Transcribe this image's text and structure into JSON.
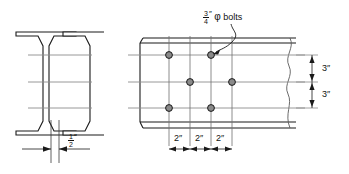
{
  "drawing": {
    "title": "Bolted beam web connection detail",
    "background_color": "#ffffff",
    "line_color": "#1a1a1a",
    "centerline_color": "#8c8c8c",
    "bolt_fill_color": "#8a8a8a"
  },
  "section_view": {
    "name": "I-beam cross section",
    "web_dimension": {
      "value_numerator": "1",
      "value_denominator": "2",
      "unit_mark": "″"
    }
  },
  "elevation_view": {
    "name": "Beam web elevation with staggered bolt group",
    "bolt_note": {
      "numerator": "3",
      "denominator": "4",
      "unit_mark": "″",
      "symbol": "φ",
      "text": "bolts"
    },
    "horizontal_dimensions": [
      {
        "label": "2″"
      },
      {
        "label": "2″"
      },
      {
        "label": "2″"
      }
    ],
    "vertical_dimensions": [
      {
        "label": "3″"
      },
      {
        "label": "3″"
      }
    ],
    "bolt_rows": [
      {
        "row": "top",
        "columns": [
          1,
          3
        ]
      },
      {
        "row": "middle",
        "columns": [
          2,
          4
        ]
      },
      {
        "row": "bottom",
        "columns": [
          1,
          3
        ]
      }
    ],
    "break_line": "wavy-break"
  }
}
